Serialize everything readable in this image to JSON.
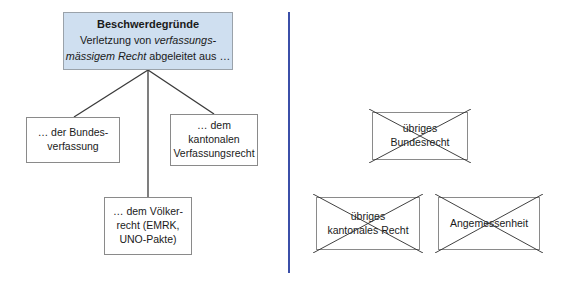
{
  "diagram": {
    "colors": {
      "root_fill": "#cfdff0",
      "root_border": "#9aa2aa",
      "box_border": "#8a8a8a",
      "divider": "#3b4fa8",
      "connector": "#3a3a3a",
      "strike": "#2b2b2b",
      "background": "#ffffff",
      "text": "#1a1a1a"
    },
    "root": {
      "heading": "Beschwerdegründe",
      "body_line1_pre": "Verletzung von ",
      "body_line1_em": "verfassungs-",
      "body_line2_em": "mässigem Recht",
      "body_line2_post": " abgeleitet aus …"
    },
    "branches": [
      {
        "id": "bundesverfassung",
        "lines": [
          "… der Bundes-",
          "verfassung"
        ],
        "struck": false
      },
      {
        "id": "kantonal-verfassung",
        "lines": [
          "… dem",
          "kantonalen",
          "Verfassungsrecht"
        ],
        "struck": false
      },
      {
        "id": "voelkerrecht",
        "lines": [
          "… dem Völker-",
          "recht (EMRK,",
          "UNO-Pakte)"
        ],
        "struck": false
      }
    ],
    "excluded": [
      {
        "id": "uebriges-bundesrecht",
        "lines": [
          "übriges",
          "Bundesrecht"
        ],
        "struck": true
      },
      {
        "id": "uebriges-kantonales-recht",
        "lines": [
          "übriges",
          "kantonales Recht"
        ],
        "struck": true
      },
      {
        "id": "angemessenheit",
        "lines": [
          "Angemessenheit"
        ],
        "struck": true
      }
    ],
    "divider": {
      "orientation": "vertical",
      "label": "section-divider"
    }
  }
}
